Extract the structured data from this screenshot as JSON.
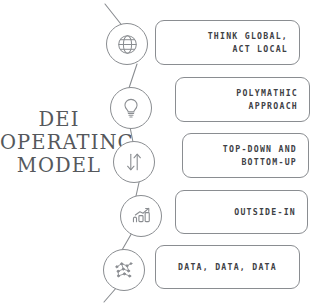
{
  "diagram": {
    "headline": "DEI\nOPERATING\nMODEL",
    "line_color": "#8a8d91",
    "text_color": "#3e4145",
    "headline_color": "#55585c",
    "background": "#ffffff",
    "steps": [
      {
        "icon": "globe-icon",
        "lines": [
          "THINK GLOBAL,",
          "ACT LOCAL"
        ],
        "align": "right"
      },
      {
        "icon": "lightbulb-icon",
        "lines": [
          "POLYMATHIC",
          "APPROACH"
        ],
        "align": "right"
      },
      {
        "icon": "up-down-arrows-icon",
        "lines": [
          "TOP-DOWN AND",
          "BOTTOM-UP"
        ],
        "align": "right"
      },
      {
        "icon": "bar-chart-growth-icon",
        "lines": [
          "OUTSIDE-IN"
        ],
        "align": "right"
      },
      {
        "icon": "data-points-icon",
        "lines": [
          "DATA, DATA, DATA"
        ],
        "align": "center"
      }
    ]
  }
}
